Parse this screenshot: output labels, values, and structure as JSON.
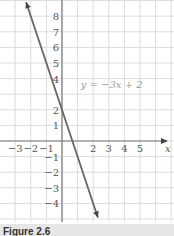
{
  "chart_data": {
    "type": "line",
    "title": "",
    "xlabel": "x",
    "ylabel": "",
    "xlim": [
      -3.9,
      7.2
    ],
    "ylim": [
      -5,
      9
    ],
    "grid": true,
    "x_ticks": [
      "-3",
      "-2",
      "-1",
      "2",
      "3",
      "4",
      "5"
    ],
    "x_tick_values": [
      -3,
      -2,
      -1,
      2,
      3,
      4,
      5
    ],
    "y_ticks": [
      "8",
      "7",
      "6",
      "5",
      "4",
      "2",
      "1",
      "-1",
      "-2",
      "-3",
      "-4"
    ],
    "y_tick_values": [
      8,
      7,
      6,
      5,
      4,
      2,
      1,
      -1,
      -2,
      -3,
      -4
    ],
    "series": [
      {
        "name": "y = −3x + 2",
        "slope": -3,
        "intercept": 2,
        "x": [
          -2.3,
          2.3
        ],
        "y": [
          8.9,
          -4.9
        ]
      }
    ],
    "annotations": [
      {
        "text": "y = −3x + 2",
        "x": 1.2,
        "y": 3.4
      }
    ],
    "colors": {
      "line": "#666666",
      "grid": "#dcdcdc",
      "axis": "#777777"
    }
  },
  "caption": "Figure 2.6"
}
